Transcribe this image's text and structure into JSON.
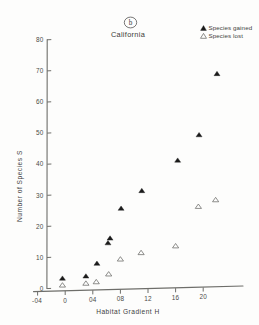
{
  "panel": {
    "letter": "b",
    "region": "California"
  },
  "legend": {
    "position": "top-right",
    "entries": [
      {
        "marker": "filled-triangle",
        "label": "Species gained"
      },
      {
        "marker": "open-triangle",
        "label": "Species lost"
      }
    ]
  },
  "axes": {
    "x": {
      "label": "Habitat  Gradient H",
      "ticks": [
        "-04",
        "0",
        "04",
        "08",
        "12",
        "16",
        "20"
      ],
      "tick_values": [
        -0.4,
        0,
        0.4,
        0.8,
        1.2,
        1.6,
        2.0
      ],
      "range": [
        -0.45,
        2.3
      ]
    },
    "y": {
      "label": "Number of Species S",
      "ticks": [
        "0",
        "10",
        "20",
        "30",
        "40",
        "50",
        "60",
        "70",
        "80"
      ],
      "tick_values": [
        0,
        10,
        20,
        30,
        40,
        50,
        60,
        70,
        80
      ],
      "range": [
        0,
        80
      ]
    }
  },
  "chart_data": {
    "type": "scatter",
    "title": "California",
    "annotation": "b",
    "xlabel": "Habitat  Gradient H",
    "ylabel": "Number of Species S",
    "xlim": [
      -0.45,
      2.3
    ],
    "ylim": [
      0,
      80
    ],
    "grid": false,
    "legend_position": "top-right",
    "series": [
      {
        "name": "Species gained",
        "marker": "filled-triangle",
        "color": "#1b1b1b",
        "points": [
          {
            "x": -0.04,
            "y": 3.0
          },
          {
            "x": 0.3,
            "y": 3.5
          },
          {
            "x": 0.46,
            "y": 7.5
          },
          {
            "x": 0.62,
            "y": 14.0
          },
          {
            "x": 0.65,
            "y": 15.5
          },
          {
            "x": 0.81,
            "y": 25.0
          },
          {
            "x": 1.11,
            "y": 30.5
          },
          {
            "x": 1.63,
            "y": 40.0
          },
          {
            "x": 1.94,
            "y": 48.0
          },
          {
            "x": 2.2,
            "y": 67.5
          }
        ]
      },
      {
        "name": "Species lost",
        "marker": "open-triangle",
        "color": "#6a6a67",
        "points": [
          {
            "x": -0.04,
            "y": 0.8
          },
          {
            "x": 0.3,
            "y": 1.2
          },
          {
            "x": 0.45,
            "y": 1.6
          },
          {
            "x": 0.63,
            "y": 4.0
          },
          {
            "x": 0.8,
            "y": 8.7
          },
          {
            "x": 1.1,
            "y": 10.6
          },
          {
            "x": 1.6,
            "y": 12.5
          },
          {
            "x": 1.93,
            "y": 25.0
          },
          {
            "x": 2.18,
            "y": 27.0
          }
        ]
      }
    ]
  }
}
